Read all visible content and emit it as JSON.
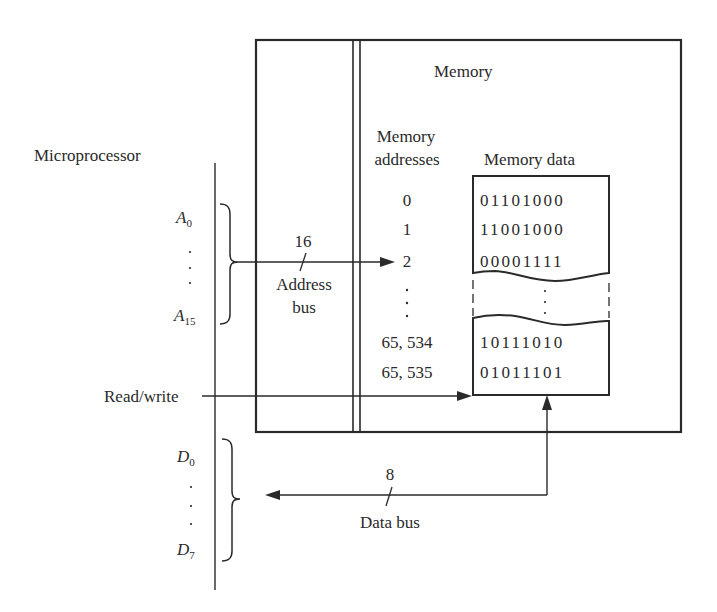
{
  "diagram": {
    "microprocessor_label": "Microprocessor",
    "memory_label": "Memory",
    "addresses_header": [
      "Memory",
      "addresses"
    ],
    "data_header": "Memory data",
    "addresses": [
      "0",
      "1",
      "2",
      "65, 534",
      "65, 535"
    ],
    "data_top": [
      "01101000",
      "11001000",
      "00001111"
    ],
    "data_bottom": [
      "10111010",
      "01011101"
    ],
    "address_lines": {
      "first": "A",
      "first_sub": "0",
      "last": "A",
      "last_sub": "15"
    },
    "data_lines": {
      "first": "D",
      "first_sub": "0",
      "last": "D",
      "last_sub": "7"
    },
    "address_bus": {
      "width": "16",
      "label": [
        "Address",
        "bus"
      ]
    },
    "data_bus": {
      "width": "8",
      "label": "Data bus"
    },
    "read_write_label": "Read/write",
    "colors": {
      "ink": "#2a2a2a",
      "background": "#ffffff"
    }
  }
}
